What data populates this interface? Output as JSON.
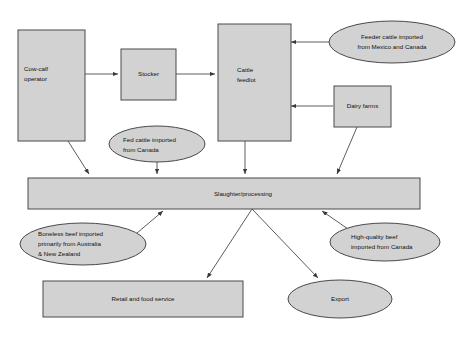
{
  "diagram": {
    "background_color": "#ffffff",
    "shape_fill_color": "#d2d2d2",
    "shape_stroke_color": "#4a4a4a",
    "text_color": "#111111",
    "nodes": {
      "cow_calf_operator": {
        "label_line_1": "Cow-calf",
        "label_line_2": "operator",
        "shape": "rectangle"
      },
      "stocker": {
        "label_line_1": "Stocker",
        "shape": "rectangle"
      },
      "cattle_feedlot": {
        "label_line_1": "Cattle",
        "label_line_2": "feedlot",
        "shape": "rectangle"
      },
      "dairy_farms": {
        "label_line_1": "Dairy farms",
        "shape": "rectangle"
      },
      "feeder_cattle_imported": {
        "label_line_1": "Feeder cattle imported",
        "label_line_2": "from Mexico and Canada",
        "shape": "ellipse"
      },
      "fed_cattle_imported": {
        "label_line_1": "Fed cattle imported",
        "label_line_2": "from Canada",
        "shape": "ellipse"
      },
      "slaughter_processing": {
        "label_line_1": "Slaughter/processing",
        "shape": "rectangle"
      },
      "boneless_beef_imported": {
        "label_line_1": "Boneless beef imported",
        "label_line_2": "primarily from Australia",
        "label_line_3": "& New Zealand",
        "shape": "ellipse"
      },
      "high_quality_beef_imported": {
        "label_line_1": "High-quality beef",
        "label_line_2": "imported from Canada",
        "shape": "ellipse"
      },
      "retail_and_food_service": {
        "label_line_1": "Retail and food service",
        "shape": "rectangle"
      },
      "export": {
        "label_line_1": "Export",
        "shape": "ellipse"
      }
    },
    "edges": [
      {
        "from": "cow_calf_operator",
        "to": "stocker",
        "arrow": true
      },
      {
        "from": "stocker",
        "to": "cattle_feedlot",
        "arrow": true
      },
      {
        "from": "feeder_cattle_imported",
        "to": "cattle_feedlot",
        "arrow": true
      },
      {
        "from": "dairy_farms",
        "to": "cattle_feedlot",
        "arrow": true
      },
      {
        "from": "cow_calf_operator",
        "to": "slaughter_processing",
        "arrow": true
      },
      {
        "from": "fed_cattle_imported",
        "to": "slaughter_processing",
        "arrow": true
      },
      {
        "from": "cattle_feedlot",
        "to": "slaughter_processing",
        "arrow": true
      },
      {
        "from": "dairy_farms",
        "to": "slaughter_processing",
        "arrow": true
      },
      {
        "from": "boneless_beef_imported",
        "to": "slaughter_processing",
        "arrow": true
      },
      {
        "from": "high_quality_beef_imported",
        "to": "slaughter_processing",
        "arrow": true
      },
      {
        "from": "slaughter_processing",
        "to": "retail_and_food_service",
        "arrow": true
      },
      {
        "from": "slaughter_processing",
        "to": "export",
        "arrow": true
      }
    ]
  }
}
